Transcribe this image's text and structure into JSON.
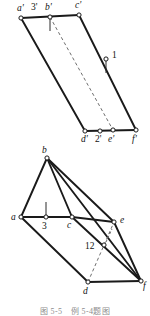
{
  "figure": {
    "caption": "图 5-5　例 5-4题图",
    "line_colors": {
      "visible_edge": "#1a1a1a",
      "hidden_edge": "#6f6f6f",
      "node_fill": "#ffffff",
      "background": "#ffffff",
      "text": "#111111"
    },
    "views": [
      {
        "name": "front-view",
        "view_label": "V projection (primed letters)",
        "vertices": [
          {
            "id": "a-prime",
            "label": "a'",
            "x": 21,
            "y": 18,
            "label_x": 17,
            "label_y": 11,
            "marker": true
          },
          {
            "id": "b-prime",
            "label": "b'",
            "x": 50,
            "y": 17,
            "label_x": 45,
            "label_y": 10,
            "marker": true
          },
          {
            "id": "c-prime",
            "label": "c'",
            "x": 79,
            "y": 15,
            "label_x": 75,
            "label_y": 8,
            "marker": true
          },
          {
            "id": "d-prime",
            "label": "d'",
            "x": 85,
            "y": 131,
            "label_x": 81,
            "label_y": 142,
            "marker": true
          },
          {
            "id": "e-prime",
            "label": "e'",
            "x": 113,
            "y": 130,
            "label_x": 108,
            "label_y": 142,
            "marker": true
          },
          {
            "id": "f-prime",
            "label": "f'",
            "x": 136,
            "y": 130,
            "label_x": 132,
            "label_y": 142,
            "marker": true
          }
        ],
        "points": [
          {
            "id": "point-3-prime",
            "label": "3'",
            "x": 36,
            "y": 18,
            "label_x": 31,
            "label_y": 10,
            "marker": false
          },
          {
            "id": "point-1",
            "label": "1",
            "x": 106,
            "y": 59,
            "label_x": 112,
            "label_y": 58,
            "marker": true
          },
          {
            "id": "point-2-prime",
            "label": "2'",
            "x": 100,
            "y": 131,
            "label_x": 95,
            "label_y": 142,
            "marker": true
          }
        ],
        "edges": [
          {
            "id": "edge-ap-cp",
            "from": "a-prime",
            "to": "c-prime",
            "style": "visible"
          },
          {
            "id": "edge-cp-fp",
            "from": "c-prime",
            "to": "f-prime",
            "style": "visible"
          },
          {
            "id": "edge-fp-dp",
            "from": "f-prime",
            "to": "d-prime",
            "style": "visible"
          },
          {
            "id": "edge-dp-ap",
            "from": "d-prime",
            "to": "a-prime",
            "style": "visible"
          },
          {
            "id": "edge-bp-ep",
            "from": "b-prime",
            "to": "e-prime",
            "style": "hidden"
          }
        ],
        "tick_marks": [
          {
            "id": "tick-b-prime",
            "x1": 50,
            "y1": 19,
            "x2": 50,
            "y2": 31,
            "style": "visible"
          },
          {
            "id": "tick-point-1",
            "x1": 106,
            "y1": 61,
            "x2": 106,
            "y2": 73,
            "style": "visible"
          }
        ]
      },
      {
        "name": "top-view",
        "view_label": "H projection (plain letters)",
        "vertices": [
          {
            "id": "a",
            "label": "a",
            "x": 21,
            "y": 217,
            "label_x": 11,
            "label_y": 219,
            "marker": true
          },
          {
            "id": "b",
            "label": "b",
            "x": 47,
            "y": 158,
            "label_x": 42,
            "label_y": 153,
            "marker": true
          },
          {
            "id": "c",
            "label": "c",
            "x": 72,
            "y": 217,
            "label_x": 67,
            "label_y": 228,
            "marker": true
          },
          {
            "id": "d",
            "label": "d",
            "x": 88,
            "y": 282,
            "label_x": 83,
            "label_y": 294,
            "marker": true
          },
          {
            "id": "e",
            "label": "e",
            "x": 114,
            "y": 222,
            "label_x": 120,
            "label_y": 222,
            "marker": true
          },
          {
            "id": "f",
            "label": "f",
            "x": 141,
            "y": 281,
            "label_x": 144,
            "label_y": 288,
            "marker": true
          }
        ],
        "points": [
          {
            "id": "point-3",
            "label": "3",
            "x": 46,
            "y": 217,
            "label_x": 42,
            "label_y": 229,
            "marker": true
          },
          {
            "id": "point-12",
            "label": "12",
            "x": 104,
            "y": 245,
            "label_x": 85,
            "label_y": 249,
            "marker": true
          }
        ],
        "edges": [
          {
            "id": "edge-a-b",
            "from": "a",
            "to": "b",
            "style": "visible"
          },
          {
            "id": "edge-b-c",
            "from": "b",
            "to": "c",
            "style": "visible"
          },
          {
            "id": "edge-a-c",
            "from": "a",
            "to": "c",
            "style": "visible"
          },
          {
            "id": "edge-b-e",
            "from": "b",
            "to": "e",
            "style": "visible"
          },
          {
            "id": "edge-b-f",
            "from": "b",
            "to": "f",
            "style": "visible"
          },
          {
            "id": "edge-c-e",
            "from": "c",
            "to": "e",
            "style": "visible"
          },
          {
            "id": "edge-e-f",
            "from": "e",
            "to": "f",
            "style": "visible"
          },
          {
            "id": "edge-a-d",
            "from": "a",
            "to": "d",
            "style": "visible"
          },
          {
            "id": "edge-d-f",
            "from": "d",
            "to": "f",
            "style": "visible"
          },
          {
            "id": "edge-c-f",
            "from": "c",
            "to": "f",
            "style": "visible"
          },
          {
            "id": "edge-d-e",
            "from": "d",
            "to": "e",
            "style": "hidden"
          }
        ],
        "tick_marks": [
          {
            "id": "tick-point-3",
            "x1": 46,
            "y1": 215,
            "x2": 46,
            "y2": 202,
            "style": "visible"
          },
          {
            "id": "tick-point-12",
            "x1": 106,
            "y1": 242,
            "x2": 112,
            "y2": 229,
            "style": "hidden"
          }
        ]
      }
    ]
  }
}
